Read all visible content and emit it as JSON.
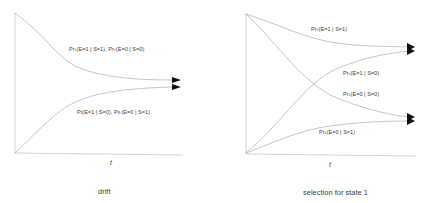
{
  "panels": [
    {
      "caption": "drift",
      "x_axis_label": "t",
      "curves": [
        {
          "label": "Prₜ(E=1 | S=1), Prₜ(E=0 | S=0)",
          "direction": "decreasing"
        },
        {
          "label": "Pt(E=1 | S=0), Prₜ(E=0 | S=1)",
          "direction": "increasing"
        }
      ]
    },
    {
      "caption": "selection for state 1",
      "x_axis_label": "t",
      "curves": [
        {
          "label": "Prₜ(E=1 | S=1)",
          "direction": "decreasing-to-high"
        },
        {
          "label": "Prₜ(E=1 | S=0)",
          "direction": "increasing-to-high"
        },
        {
          "label": "Prₜ(E=0 | S=0)",
          "direction": "decreasing-to-low"
        },
        {
          "label": "Prₜ(E=0 | S=1)",
          "direction": "increasing-to-low"
        }
      ]
    }
  ],
  "colors": {
    "line": "#b8b8b8",
    "axis": "#c4c4c4",
    "arrow": "#111111",
    "text": "#444444"
  }
}
